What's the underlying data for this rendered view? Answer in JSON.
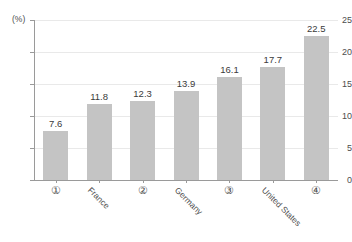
{
  "chart_data": {
    "type": "bar",
    "title": "",
    "xlabel": "",
    "ylabel": "(%)",
    "ylim": [
      0,
      25
    ],
    "yticks": [
      0,
      5,
      10,
      15,
      20,
      25
    ],
    "ytick_labels": [
      "0",
      "5",
      "10",
      "15",
      "20",
      "25"
    ],
    "grid": true,
    "legend": "none",
    "categories": [
      "①",
      "France",
      "②",
      "Germany",
      "③",
      "United States",
      "④"
    ],
    "category_styles": [
      "circled",
      "rotated",
      "circled",
      "rotated",
      "circled",
      "rotated",
      "circled"
    ],
    "values": [
      7.6,
      11.8,
      12.3,
      13.9,
      16.1,
      17.7,
      22.5
    ],
    "value_labels": [
      "7.6",
      "11.8",
      "12.3",
      "13.9",
      "16.1",
      "17.7",
      "22.5"
    ],
    "bar_color": "#c4c4c4",
    "axis_color": "#9a9a9a",
    "grid_color": "#e9e9e9",
    "text_color": "#4d4d4d"
  }
}
